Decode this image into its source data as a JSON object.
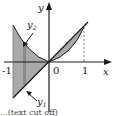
{
  "diagram": {
    "axis_labels": {
      "x": "x",
      "y": "y"
    },
    "ticks": {
      "neg_one": "-1",
      "zero": "0",
      "one": "1"
    },
    "curves": {
      "y1": {
        "name": "y",
        "sub": "1",
        "description": "line y = x"
      },
      "y2": {
        "name": "y",
        "sub": "2",
        "description": "curve"
      }
    },
    "colors": {
      "fill": "#a9a9a9",
      "stroke": "#1a1a1a",
      "dashed": "#555555"
    },
    "caption": "...(text cut off)"
  }
}
